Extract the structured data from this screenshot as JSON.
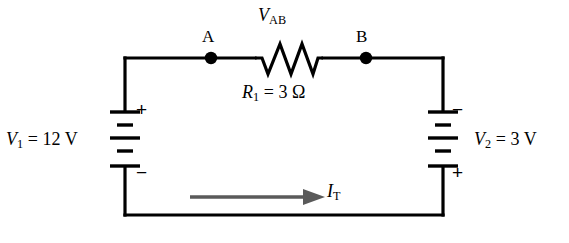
{
  "diagram": {
    "background_color": "#ffffff",
    "wire_color": "#000000",
    "arrow_color": "#5a5a5a"
  },
  "nodes": {
    "a_label": "A",
    "b_label": "B"
  },
  "resistor": {
    "voltage_label_symbol": "V",
    "voltage_label_subscript": "AB",
    "value_symbol": "R",
    "value_subscript": "1",
    "value_text": " = 3 Ω"
  },
  "source_left": {
    "symbol": "V",
    "subscript": "1",
    "value_text": " = 12 V",
    "top_sign": "+",
    "bottom_sign": "−"
  },
  "source_right": {
    "symbol": "V",
    "subscript": "2",
    "value_text": " = 3 V",
    "top_sign": "−",
    "bottom_sign": "+"
  },
  "current": {
    "symbol": "I",
    "subscript": "T",
    "direction": "right"
  }
}
